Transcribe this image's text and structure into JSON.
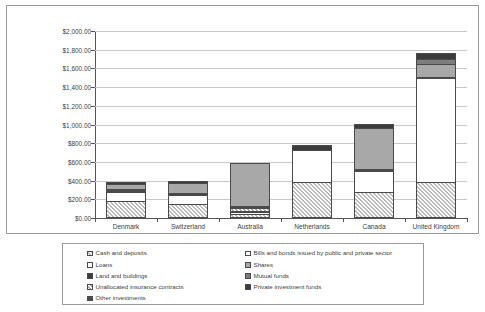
{
  "chart_data": {
    "type": "bar",
    "subtype": "stacked",
    "title": "",
    "xlabel": "Major Countries",
    "ylabel": "US $ Billions",
    "ylim": [
      0,
      2000
    ],
    "ytick_step": 200,
    "ytick_labels": [
      "$0.00",
      "$200.00",
      "$400.00",
      "$600.00",
      "$800.00",
      "$1,000.00",
      "$1,200.00",
      "$1,400.00",
      "$1,600.00",
      "$1,800.00",
      "$2,000.00"
    ],
    "grid": true,
    "legend_position": "bottom",
    "categories": [
      "Denmark",
      "Switzerland",
      "Australia",
      "Netherlands",
      "Canada",
      "United Kingdom"
    ],
    "series": [
      {
        "name": "Cash and deposits",
        "swatch": "light-hatch",
        "values": [
          185,
          150,
          40,
          380,
          275,
          390
        ]
      },
      {
        "name": "Loans",
        "swatch": "white",
        "values": [
          95,
          95,
          20,
          350,
          225,
          1110
        ]
      },
      {
        "name": "Land and buildings",
        "swatch": "black",
        "values": [
          12,
          12,
          20,
          0,
          10,
          12
        ]
      },
      {
        "name": "Unallocated insurance contracts",
        "swatch": "gray-hatch",
        "values": [
          0,
          0,
          30,
          0,
          0,
          0
        ]
      },
      {
        "name": "Other investments",
        "swatch": "dark-gray",
        "values": [
          20,
          15,
          15,
          0,
          15,
          0
        ]
      },
      {
        "name": "Bills and bonds issued by public and private sector",
        "swatch": "white2",
        "values": [
          0,
          0,
          0,
          0,
          0,
          0
        ]
      },
      {
        "name": "Shares",
        "swatch": "mid-gray",
        "values": [
          50,
          105,
          465,
          0,
          440,
          135
        ]
      },
      {
        "name": "Mutual funds",
        "swatch": "gray",
        "values": [
          0,
          0,
          0,
          0,
          0,
          55
        ]
      },
      {
        "name": "Private investment funds",
        "swatch": "dark",
        "values": [
          18,
          15,
          0,
          50,
          40,
          60
        ]
      }
    ],
    "totals": [
      380,
      392,
      590,
      780,
      1005,
      1762
    ]
  },
  "legend": {
    "left_column": [
      {
        "label": "Cash and deposits",
        "swatch": "light-hatch"
      },
      {
        "label": "Loans",
        "swatch": "white"
      },
      {
        "label": "Land and buildings",
        "swatch": "black"
      },
      {
        "label": "Unallocated insurance contracts",
        "swatch": "gray-hatch"
      },
      {
        "label": "Other investments",
        "swatch": "dark-gray"
      }
    ],
    "right_column": [
      {
        "label": "Bills and bonds issued by public and private sector",
        "swatch": "white2"
      },
      {
        "label": "Shares",
        "swatch": "mid-gray"
      },
      {
        "label": "Mutual funds",
        "swatch": "gray"
      },
      {
        "label": "Private investment funds",
        "swatch": "white3"
      }
    ]
  }
}
